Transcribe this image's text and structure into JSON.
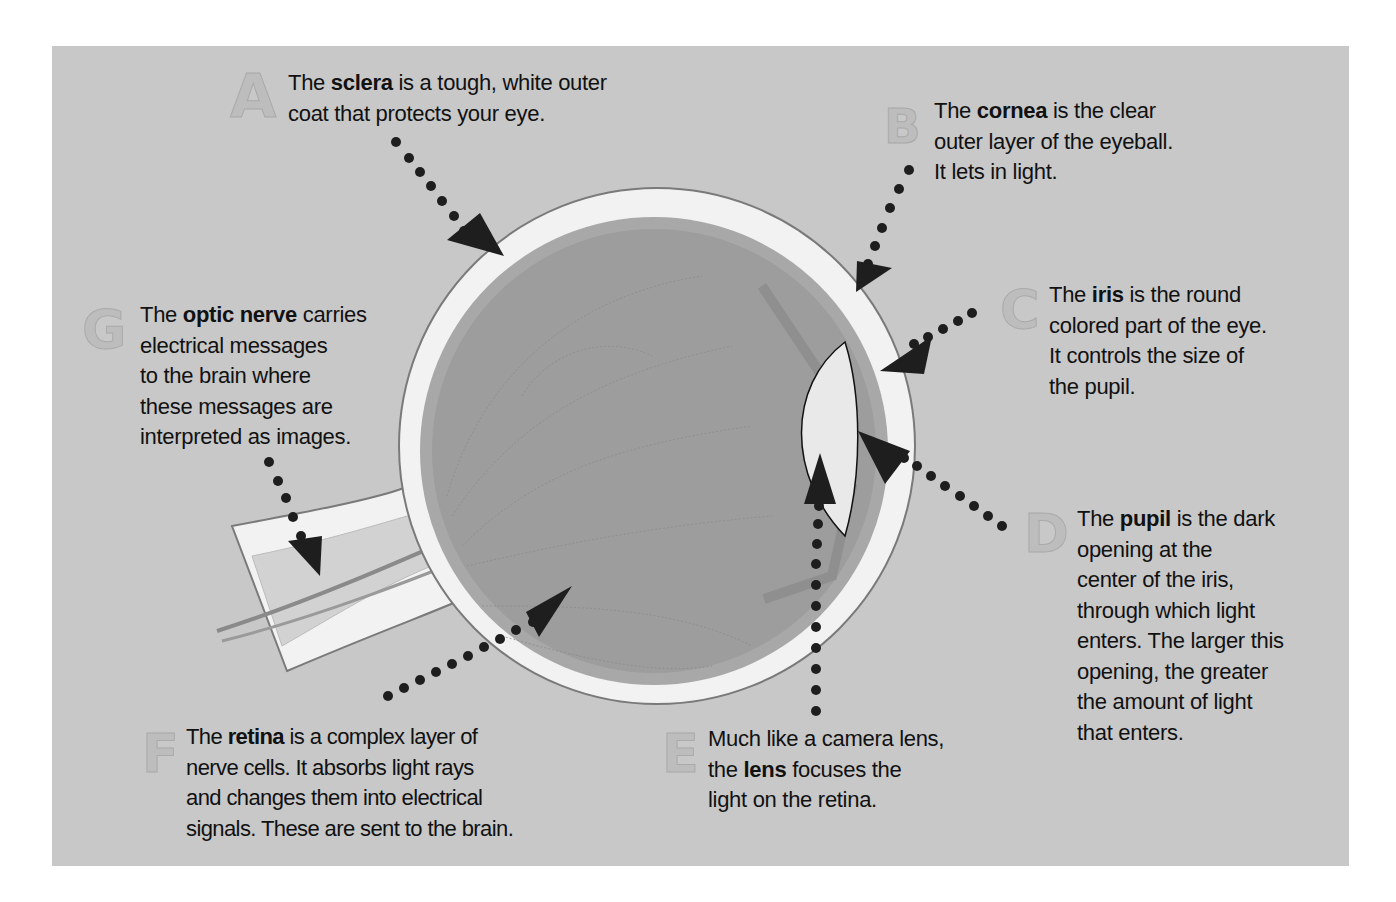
{
  "diagram": {
    "title": "",
    "background_color": "#c8c8c8",
    "callouts": [
      {
        "id": "A",
        "letter": "A",
        "part": "sclera",
        "lines": [
          {
            "pre": "The ",
            "bold": "sclera",
            "post": " is a tough, white outer"
          },
          {
            "pre": "coat that protects your eye.",
            "bold": "",
            "post": ""
          }
        ]
      },
      {
        "id": "B",
        "letter": "B",
        "part": "cornea",
        "lines": [
          {
            "pre": "The ",
            "bold": "cornea",
            "post": " is the clear"
          },
          {
            "pre": "outer layer of the eyeball.",
            "bold": "",
            "post": ""
          },
          {
            "pre": "It lets in light.",
            "bold": "",
            "post": ""
          }
        ]
      },
      {
        "id": "C",
        "letter": "C",
        "part": "iris",
        "lines": [
          {
            "pre": "The ",
            "bold": "iris",
            "post": " is the round"
          },
          {
            "pre": "colored part of the eye.",
            "bold": "",
            "post": ""
          },
          {
            "pre": "It controls the size of",
            "bold": "",
            "post": ""
          },
          {
            "pre": "the pupil.",
            "bold": "",
            "post": ""
          }
        ]
      },
      {
        "id": "D",
        "letter": "D",
        "part": "pupil",
        "lines": [
          {
            "pre": "The ",
            "bold": "pupil",
            "post": " is the dark"
          },
          {
            "pre": "opening at the",
            "bold": "",
            "post": ""
          },
          {
            "pre": "center of the iris,",
            "bold": "",
            "post": ""
          },
          {
            "pre": "through which light",
            "bold": "",
            "post": ""
          },
          {
            "pre": "enters. The larger this",
            "bold": "",
            "post": ""
          },
          {
            "pre": "opening, the greater",
            "bold": "",
            "post": ""
          },
          {
            "pre": "the amount of light",
            "bold": "",
            "post": ""
          },
          {
            "pre": "that enters.",
            "bold": "",
            "post": ""
          }
        ]
      },
      {
        "id": "E",
        "letter": "E",
        "part": "lens",
        "lines": [
          {
            "pre": "Much like a camera lens,",
            "bold": "",
            "post": ""
          },
          {
            "pre": "the ",
            "bold": "lens",
            "post": " focuses the"
          },
          {
            "pre": "light on the retina.",
            "bold": "",
            "post": ""
          }
        ]
      },
      {
        "id": "F",
        "letter": "F",
        "part": "retina",
        "lines": [
          {
            "pre": "The ",
            "bold": "retina",
            "post": " is a complex layer of"
          },
          {
            "pre": "nerve cells. It absorbs light rays",
            "bold": "",
            "post": ""
          },
          {
            "pre": "and changes them into electrical",
            "bold": "",
            "post": ""
          },
          {
            "pre": "signals. These are sent to the brain.",
            "bold": "",
            "post": ""
          }
        ]
      },
      {
        "id": "G",
        "letter": "G",
        "part": "optic nerve",
        "lines": [
          {
            "pre": "The ",
            "bold": "optic nerve",
            "post": " carries"
          },
          {
            "pre": "electrical messages",
            "bold": "",
            "post": ""
          },
          {
            "pre": "to the brain where",
            "bold": "",
            "post": ""
          },
          {
            "pre": "these messages are",
            "bold": "",
            "post": ""
          },
          {
            "pre": "interpreted as images.",
            "bold": "",
            "post": ""
          }
        ]
      }
    ]
  }
}
